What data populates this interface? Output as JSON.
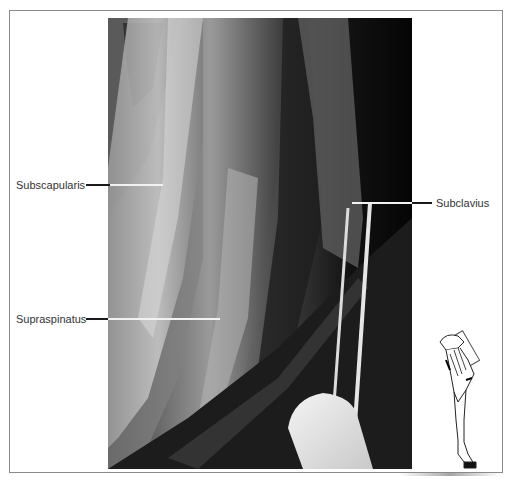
{
  "figure": {
    "type": "anatomical dissection photograph",
    "rendering": "grayscale",
    "labels": [
      {
        "id": "subscapularis",
        "text": "Subscapularis",
        "side": "left"
      },
      {
        "id": "supraspinatus",
        "text": "Supraspinatus",
        "side": "left"
      },
      {
        "id": "subclavius",
        "text": "Subclavius",
        "side": "right"
      }
    ],
    "inset": {
      "description": "line drawing of equine forelimb with highlighted shoulder region",
      "icon": "forelimb-orientation-icon"
    },
    "colors": {
      "frame": "#8a8a8a",
      "leader_line": "#1a1a1a",
      "leader_line_on_photo": "#f2f2f2",
      "label_text": "#333333"
    }
  }
}
